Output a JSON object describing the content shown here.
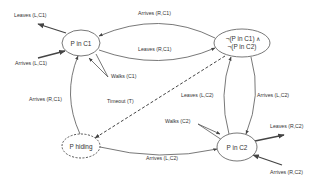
{
  "diagram": {
    "type": "state-transition",
    "colors": {
      "stroke": "#555555",
      "text": "#333333",
      "background": "#ffffff"
    },
    "nodes": [
      {
        "id": "p_in_c1",
        "label": "P in C1",
        "style": "solid"
      },
      {
        "id": "not_in_either",
        "label_line1": "¬(P in C1) ∧",
        "label_line2": "¬(P in C2)",
        "style": "solid"
      },
      {
        "id": "p_in_c2",
        "label": "P in C2",
        "style": "solid"
      },
      {
        "id": "p_hiding",
        "label": "P hiding",
        "style": "dashed"
      }
    ],
    "edges": [
      {
        "id": "leaves_l_c1",
        "label": "Leaves (L,C1)",
        "from": "p_in_c1",
        "to": "outside"
      },
      {
        "id": "arrives_l_c1",
        "label": "Arrives (L,C1)",
        "from": "outside",
        "to": "p_in_c1"
      },
      {
        "id": "arrives_r_c1",
        "label": "Arrives (R,C1)",
        "from": "not_in_either",
        "to": "p_in_c1"
      },
      {
        "id": "leaves_r_c1",
        "label": "Leaves (R,C1)",
        "from": "p_in_c1",
        "to": "not_in_either"
      },
      {
        "id": "walks_c1",
        "label": "Walks (C1)",
        "from": "p_in_c1",
        "to": "p_in_c1"
      },
      {
        "id": "arrives_r_c1_hiding",
        "label": "Arrives (R,C1)",
        "from": "p_hiding",
        "to": "p_in_c1"
      },
      {
        "id": "timeout",
        "label": "Timeout (T)",
        "from": "not_in_either",
        "to": "p_hiding",
        "style": "dashed"
      },
      {
        "id": "leaves_l_c2",
        "label": "Leaves (L,C2)",
        "from": "p_in_c2",
        "to": "not_in_either"
      },
      {
        "id": "arrives_l_c2_top",
        "label": "Arrives (L,C2)",
        "from": "not_in_either",
        "to": "p_in_c2"
      },
      {
        "id": "walks_c2",
        "label": "Walks (C2)",
        "from": "p_in_c2",
        "to": "p_in_c2"
      },
      {
        "id": "leaves_r_c2",
        "label": "Leaves (R,C2)",
        "from": "p_in_c2",
        "to": "outside"
      },
      {
        "id": "arrives_r_c2",
        "label": "Arrives (R,C2)",
        "from": "outside",
        "to": "p_in_c2"
      },
      {
        "id": "arrives_l_c2_hiding",
        "label": "Arrives (L,C2)",
        "from": "p_hiding",
        "to": "p_in_c2"
      }
    ]
  }
}
